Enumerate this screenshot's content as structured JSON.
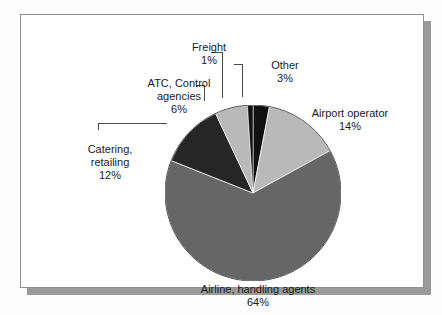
{
  "figure": {
    "background_color": "#ffffff",
    "border_color": "#8e8e8e",
    "shadow_color": "#9a9a9a"
  },
  "chart_data": {
    "type": "pie",
    "title": "",
    "subtitle": "",
    "xlabel": "",
    "ylabel": "",
    "legend_position": "none",
    "grid": false,
    "units": "percent",
    "total": 100,
    "start_angle_deg": 0,
    "direction": "clockwise",
    "categories": [
      "Other",
      "Airport operator",
      "Airline, handling agents",
      "Catering, retailing",
      "ATC, Control agencies",
      "Freight"
    ],
    "values": [
      3,
      14,
      64,
      12,
      6,
      1
    ],
    "colors": [
      "#111111",
      "#b9b9b9",
      "#666666",
      "#262626",
      "#b9b9b9",
      "#111111"
    ],
    "slices": [
      {
        "label": "Other",
        "value": 3,
        "pct_text": "3%",
        "color": "#111111",
        "label_line1": "Other",
        "label_line2": "3%"
      },
      {
        "label": "Airport operator",
        "value": 14,
        "pct_text": "14%",
        "color": "#b9b9b9",
        "label_line1": "Airport operator",
        "label_line2": "14%"
      },
      {
        "label": "Airline, handling agents",
        "value": 64,
        "pct_text": "64%",
        "color": "#666666",
        "label_line1": "Airline, handling agents",
        "label_line2": "64%"
      },
      {
        "label": "Catering, retailing",
        "value": 12,
        "pct_text": "12%",
        "color": "#262626",
        "label_line1": "Catering,",
        "label_line1b": "retailing",
        "label_line2": "12%"
      },
      {
        "label": "ATC, Control agencies",
        "value": 6,
        "pct_text": "6%",
        "color": "#b9b9b9",
        "label_line1": "ATC, Control",
        "label_line1b": "agencies",
        "label_line2": "6%"
      },
      {
        "label": "Freight",
        "value": 1,
        "pct_text": "1%",
        "color": "#111111",
        "label_line1": "Freight",
        "label_line2": "1%"
      }
    ]
  }
}
